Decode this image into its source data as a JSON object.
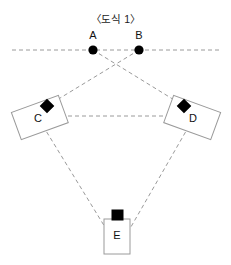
{
  "figure": {
    "title": "〈도식 1〉",
    "background_color": "#ffffff",
    "line_color": "#9a9a9a",
    "marker_color": "#000000",
    "box_stroke_color": "#9a9a9a",
    "label_color": "#111111"
  },
  "nodes": [
    {
      "id": "A",
      "label": "A",
      "type": "point-dot",
      "x": 93,
      "y": 50,
      "label_x": 93,
      "label_y": 35
    },
    {
      "id": "B",
      "label": "B",
      "type": "point-dot",
      "x": 139,
      "y": 50,
      "label_x": 139,
      "label_y": 35
    },
    {
      "id": "C",
      "label": "C",
      "type": "rotated-box",
      "x": 40,
      "y": 118,
      "rotation": -20,
      "width": 50,
      "height": 29,
      "marker_x": 47,
      "marker_y": 106,
      "marker_shape": "diamond"
    },
    {
      "id": "D",
      "label": "D",
      "type": "rotated-box",
      "x": 192,
      "y": 118,
      "rotation": 20,
      "width": 50,
      "height": 29,
      "marker_x": 184,
      "marker_y": 106,
      "marker_shape": "diamond"
    },
    {
      "id": "E",
      "label": "E",
      "type": "upright-box",
      "x": 117,
      "y": 236,
      "width": 26,
      "height": 35,
      "marker_x": 117,
      "marker_y": 215,
      "marker_shape": "square"
    }
  ],
  "edges": [
    {
      "from": "A",
      "to": "D",
      "style": "dashed"
    },
    {
      "from": "B",
      "to": "C",
      "style": "dashed"
    },
    {
      "from": "C",
      "to": "D",
      "style": "dashed"
    },
    {
      "from": "C",
      "to": "E",
      "style": "dashed"
    },
    {
      "from": "D",
      "to": "E",
      "style": "dashed"
    }
  ],
  "baseline": {
    "description": "horizontal dashed reference line through A and B",
    "x_start": 12,
    "x_end": 219,
    "y": 50,
    "style": "dashed"
  }
}
